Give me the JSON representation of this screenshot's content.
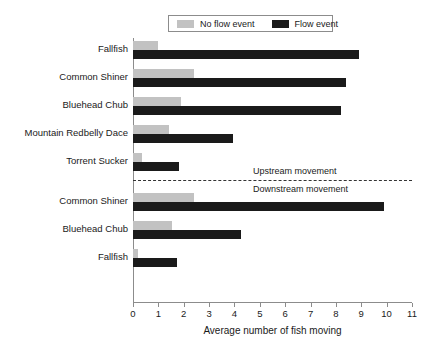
{
  "chart_data": {
    "type": "bar",
    "orientation": "horizontal",
    "title": "",
    "xlabel": "Average number of fish moving",
    "ylabel": "",
    "xlim": [
      0,
      11
    ],
    "xticks": [
      0,
      1,
      2,
      3,
      4,
      5,
      6,
      7,
      8,
      9,
      10,
      11
    ],
    "xtick_labels": [
      "0",
      "1",
      "2",
      "3",
      "4",
      "5",
      "6",
      "7",
      "8",
      "9",
      "10",
      "11"
    ],
    "grid": false,
    "legend_position": "top-center",
    "series": [
      {
        "name": "No flow event",
        "color": "#c2c2c2",
        "values": [
          1.0,
          2.4,
          1.9,
          1.4,
          0.35,
          2.4,
          1.55,
          0.2
        ]
      },
      {
        "name": "Flow event",
        "color": "#1a1a1a",
        "values": [
          8.9,
          8.4,
          8.2,
          3.95,
          1.8,
          9.9,
          4.25,
          1.75
        ]
      }
    ],
    "categories": [
      "Fallfish",
      "Common Shiner",
      "Bluehead Chub",
      "Mountain Redbelly Dace",
      "Torrent Sucker",
      "Common Shiner",
      "Bluehead Chub",
      "Fallfish"
    ],
    "annotations": [
      {
        "text": "Upstream movement",
        "after_category_index": 4
      },
      {
        "text": "Downstream movement",
        "after_category_index": 4
      }
    ],
    "divider": {
      "style": "dashed",
      "label_above": "Upstream movement",
      "label_below": "Downstream movement"
    }
  },
  "legend": {
    "entries": [
      {
        "label": "No flow event",
        "color": "#c2c2c2"
      },
      {
        "label": "Flow event",
        "color": "#1a1a1a"
      }
    ]
  }
}
